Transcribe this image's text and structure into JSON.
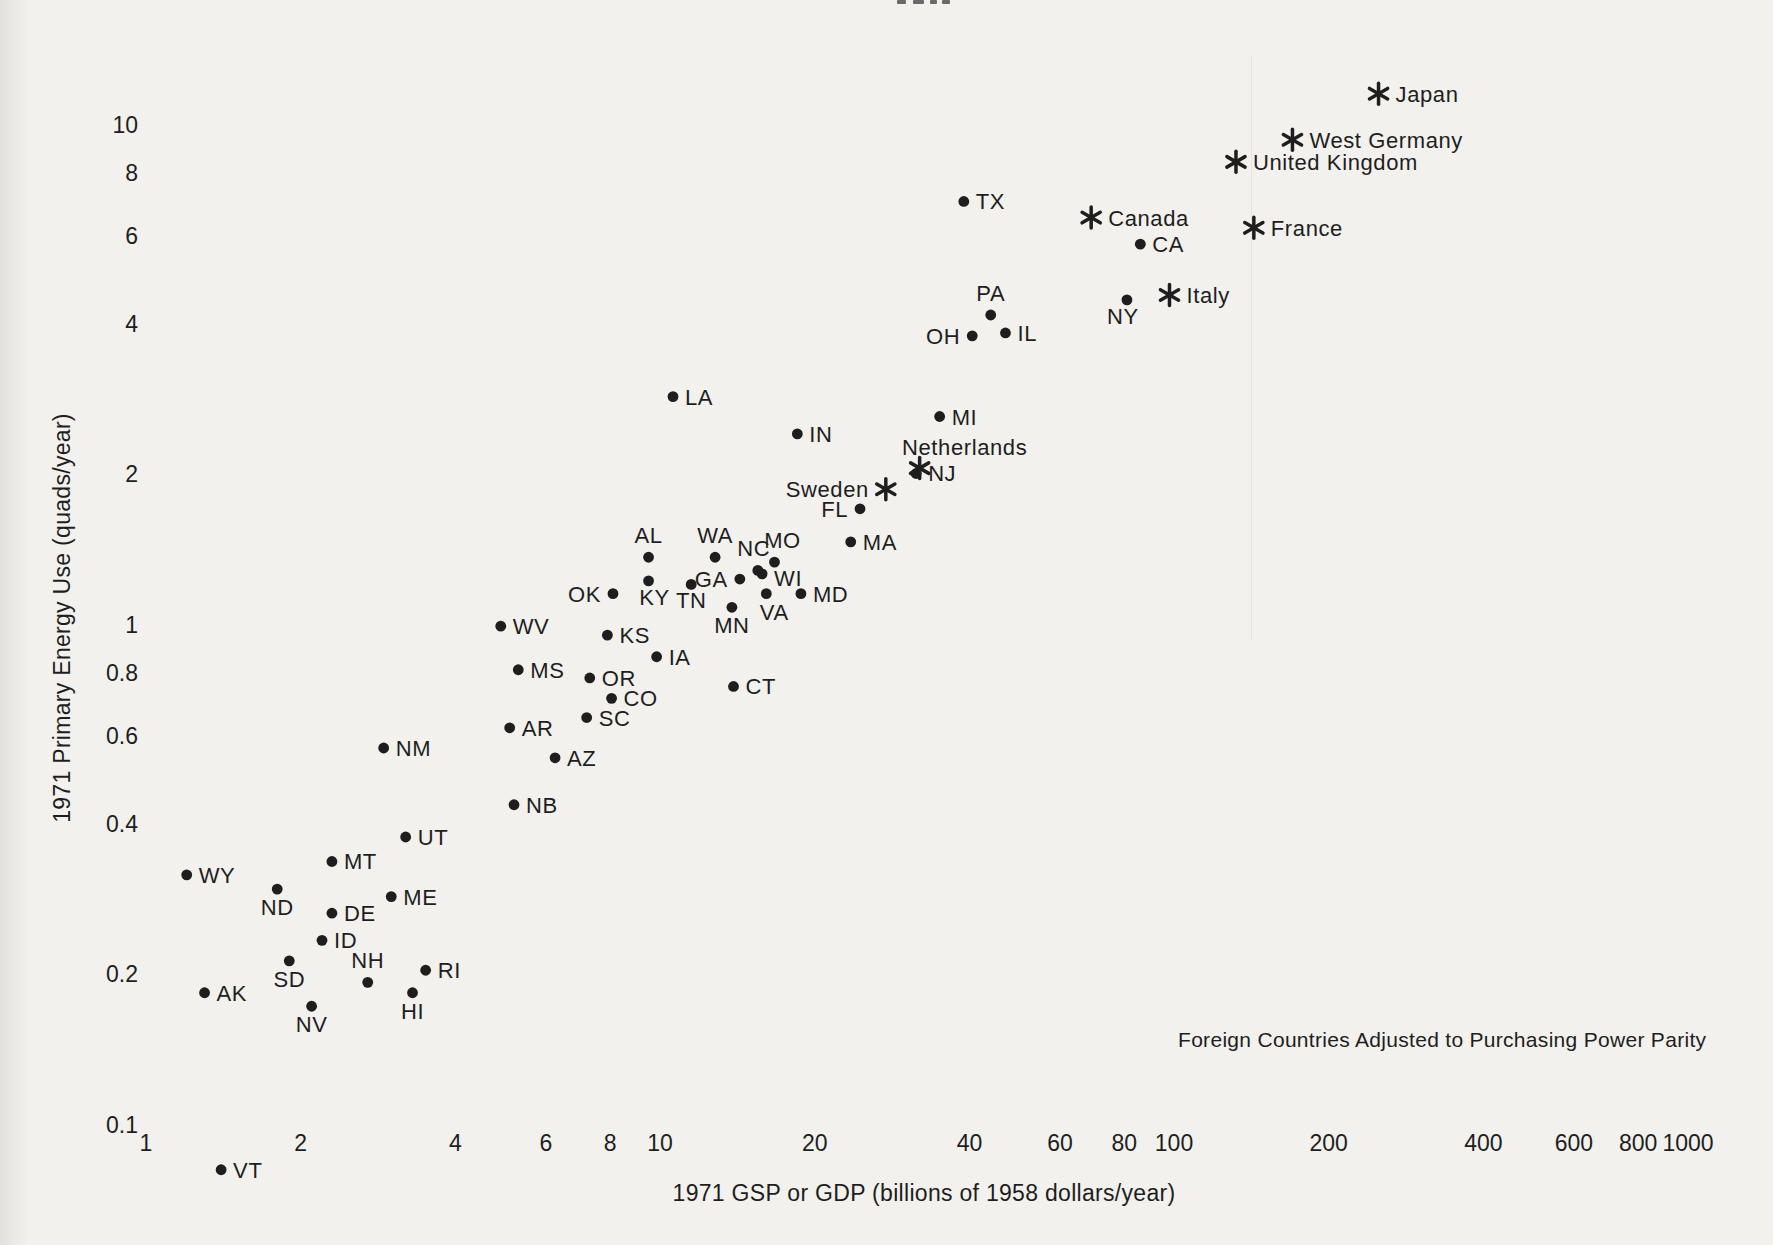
{
  "figure": {
    "background_color": "#f2f1ed",
    "ink_color": "#1e1e1e",
    "annotation": "Foreign Countries Adjusted to Purchasing Power Parity"
  },
  "chart_data": {
    "type": "scatter",
    "title": "",
    "xlabel": "1971 GSP or GDP (billions of 1958 dollars/year)",
    "ylabel": "1971 Primary Energy Use (quads/year)",
    "annotation": "Foreign Countries Adjusted to Purchasing Power Parity",
    "x_scale": "log",
    "y_scale": "log",
    "xlim": [
      1,
      1000
    ],
    "ylim": [
      0.1,
      13
    ],
    "grid": false,
    "x_ticks": [
      "1",
      "2",
      "4",
      "6",
      "8",
      "10",
      "20",
      "40",
      "60",
      "80",
      "100",
      "200",
      "400",
      "600",
      "800",
      "1000"
    ],
    "y_ticks": [
      "10",
      "8",
      "6",
      "4",
      "2",
      "1",
      "0.8",
      "0.6",
      "0.4",
      "0.2",
      "0.1"
    ],
    "series": [
      {
        "name": "US states",
        "marker": "dot",
        "points": [
          {
            "label": "TX",
            "x": 39,
            "y": 7.0,
            "a": "r"
          },
          {
            "label": "CA",
            "x": 86,
            "y": 5.75,
            "a": "r"
          },
          {
            "label": "NY",
            "x": 81,
            "y": 4.45,
            "a": "b",
            "dx": -4,
            "dy": -8
          },
          {
            "label": "PA",
            "x": 44,
            "y": 4.15,
            "a": "t"
          },
          {
            "label": "IL",
            "x": 47,
            "y": 3.82,
            "a": "r"
          },
          {
            "label": "OH",
            "x": 40.5,
            "y": 3.77,
            "a": "l"
          },
          {
            "label": "LA",
            "x": 10.6,
            "y": 2.85,
            "a": "r"
          },
          {
            "label": "MI",
            "x": 35,
            "y": 2.6,
            "a": "r"
          },
          {
            "label": "IN",
            "x": 18.5,
            "y": 2.4,
            "a": "r"
          },
          {
            "label": "NJ",
            "x": 31.5,
            "y": 2.0,
            "a": "r"
          },
          {
            "label": "FL",
            "x": 24.5,
            "y": 1.7,
            "a": "l"
          },
          {
            "label": "MA",
            "x": 23.5,
            "y": 1.46,
            "a": "r"
          },
          {
            "label": "AL",
            "x": 9.5,
            "y": 1.36,
            "a": "t"
          },
          {
            "label": "WA",
            "x": 12.8,
            "y": 1.36,
            "a": "t"
          },
          {
            "label": "NC",
            "x": 15.5,
            "y": 1.28,
            "a": "t",
            "dx": -4
          },
          {
            "label": "MO",
            "x": 16.7,
            "y": 1.33,
            "a": "t",
            "dx": 8
          },
          {
            "label": "WI",
            "x": 15.8,
            "y": 1.26,
            "a": "r",
            "dy": 4
          },
          {
            "label": "GA",
            "x": 14.3,
            "y": 1.23,
            "a": "l"
          },
          {
            "label": "KY",
            "x": 9.5,
            "y": 1.22,
            "a": "b",
            "dx": 6,
            "dy": -8
          },
          {
            "label": "TN",
            "x": 11.5,
            "y": 1.2,
            "a": "b",
            "dy": -8
          },
          {
            "label": "OK",
            "x": 8.1,
            "y": 1.15,
            "a": "l"
          },
          {
            "label": "MD",
            "x": 18.8,
            "y": 1.15,
            "a": "r"
          },
          {
            "label": "VA",
            "x": 16.1,
            "y": 1.15,
            "a": "b",
            "dx": 8,
            "dy": -6
          },
          {
            "label": "MN",
            "x": 13.8,
            "y": 1.08,
            "a": "b",
            "dy": -6
          },
          {
            "label": "WV",
            "x": 4.9,
            "y": 0.99,
            "a": "r"
          },
          {
            "label": "KS",
            "x": 7.9,
            "y": 0.95,
            "a": "r"
          },
          {
            "label": "IA",
            "x": 9.85,
            "y": 0.86,
            "a": "r"
          },
          {
            "label": "MS",
            "x": 5.3,
            "y": 0.81,
            "a": "r"
          },
          {
            "label": "OR",
            "x": 7.3,
            "y": 0.78,
            "a": "r"
          },
          {
            "label": "CT",
            "x": 13.9,
            "y": 0.75,
            "a": "r"
          },
          {
            "label": "CO",
            "x": 8.05,
            "y": 0.71,
            "a": "r"
          },
          {
            "label": "SC",
            "x": 7.2,
            "y": 0.65,
            "a": "r"
          },
          {
            "label": "AR",
            "x": 5.1,
            "y": 0.62,
            "a": "r"
          },
          {
            "label": "NM",
            "x": 2.9,
            "y": 0.565,
            "a": "r"
          },
          {
            "label": "AZ",
            "x": 6.25,
            "y": 0.54,
            "a": "r"
          },
          {
            "label": "NB",
            "x": 5.2,
            "y": 0.435,
            "a": "r"
          },
          {
            "label": "UT",
            "x": 3.2,
            "y": 0.375,
            "a": "r"
          },
          {
            "label": "MT",
            "x": 2.3,
            "y": 0.335,
            "a": "r"
          },
          {
            "label": "WY",
            "x": 1.2,
            "y": 0.315,
            "a": "r"
          },
          {
            "label": "ND",
            "x": 1.8,
            "y": 0.295,
            "a": "b",
            "dy": -6
          },
          {
            "label": "ME",
            "x": 3.0,
            "y": 0.285,
            "a": "r"
          },
          {
            "label": "DE",
            "x": 2.3,
            "y": 0.264,
            "a": "r"
          },
          {
            "label": "ID",
            "x": 2.2,
            "y": 0.233,
            "a": "r"
          },
          {
            "label": "SD",
            "x": 1.9,
            "y": 0.212,
            "a": "b",
            "dy": -6
          },
          {
            "label": "RI",
            "x": 3.5,
            "y": 0.203,
            "a": "r"
          },
          {
            "label": "NH",
            "x": 2.7,
            "y": 0.192,
            "a": "t"
          },
          {
            "label": "AK",
            "x": 1.3,
            "y": 0.183,
            "a": "r"
          },
          {
            "label": "HI",
            "x": 3.3,
            "y": 0.183,
            "a": "b",
            "dy": -6
          },
          {
            "label": "NV",
            "x": 2.1,
            "y": 0.172,
            "a": "b",
            "dy": -6
          },
          {
            "label": "VT",
            "x": 1.4,
            "y": 0.081,
            "a": "r"
          }
        ]
      },
      {
        "name": "Foreign countries",
        "marker": "asterisk",
        "points": [
          {
            "label": "Japan",
            "x": 250,
            "y": 11.5,
            "a": "r"
          },
          {
            "label": "West Germany",
            "x": 170,
            "y": 9.3,
            "a": "r"
          },
          {
            "label": "United Kingdom",
            "x": 132,
            "y": 8.4,
            "a": "r"
          },
          {
            "label": "France",
            "x": 143,
            "y": 6.2,
            "a": "r"
          },
          {
            "label": "Canada",
            "x": 69,
            "y": 6.5,
            "a": "r"
          },
          {
            "label": "Italy",
            "x": 98,
            "y": 4.55,
            "a": "r"
          },
          {
            "label": "Netherlands",
            "x": 32,
            "y": 2.05,
            "a": "t",
            "dx": 45,
            "dy": 4
          },
          {
            "label": "Sweden",
            "x": 27.5,
            "y": 1.86,
            "a": "l"
          }
        ]
      }
    ]
  }
}
